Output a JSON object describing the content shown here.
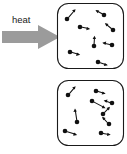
{
  "diagram": {
    "label_heat": "heat",
    "colors": {
      "arrow_gray": "#9b9b9b",
      "particle_black": "#111111",
      "box_outline": "#1a1a1a",
      "background": "#ffffff"
    },
    "heat_arrow": {
      "name": "heat-arrow",
      "direction": "right",
      "shaft_x": 2,
      "shaft_y": 31,
      "shaft_width": 36,
      "shaft_height": 12,
      "head_width": 17,
      "head_height": 24
    },
    "boxes": [
      {
        "id": "hot-box",
        "label": "heated container (fast particles)",
        "x": 57,
        "y": 3,
        "width": 67,
        "height": 66,
        "corner_radius": 11,
        "particle_count": 8,
        "particles": [
          {
            "cx": 67,
            "cy": 19,
            "r": 2.3,
            "vx": 7.5,
            "vy": -8.5
          },
          {
            "cx": 80,
            "cy": 27,
            "r": 2.3,
            "vx": 9.0,
            "vy": 2.0
          },
          {
            "cx": 104,
            "cy": 15,
            "r": 2.3,
            "vx": -8.0,
            "vy": -4.5
          },
          {
            "cx": 113,
            "cy": 30,
            "r": 2.3,
            "vx": -8.5,
            "vy": -7.0
          },
          {
            "cx": 94,
            "cy": 46,
            "r": 2.3,
            "vx": 0.5,
            "vy": -10.0
          },
          {
            "cx": 112,
            "cy": 45,
            "r": 2.3,
            "vx": -9.0,
            "vy": -2.0
          },
          {
            "cx": 70,
            "cy": 52,
            "r": 2.3,
            "vx": 9.5,
            "vy": 2.5
          },
          {
            "cx": 98,
            "cy": 62,
            "r": 2.3,
            "vx": 9.0,
            "vy": 3.0
          }
        ]
      },
      {
        "id": "cold-box",
        "label": "unheated container (slow particles)",
        "x": 57,
        "y": 80,
        "width": 67,
        "height": 66,
        "corner_radius": 11,
        "particle_count": 9,
        "particles": [
          {
            "cx": 68,
            "cy": 95,
            "r": 2.3,
            "vx": 7.0,
            "vy": -8.0
          },
          {
            "cx": 96,
            "cy": 91,
            "r": 2.3,
            "vx": 8.5,
            "vy": 2.5
          },
          {
            "cx": 92,
            "cy": 101,
            "r": 2.3,
            "vx": 14.0,
            "vy": 7.5
          },
          {
            "cx": 112,
            "cy": 103,
            "r": 2.3,
            "vx": -7.0,
            "vy": -2.5
          },
          {
            "cx": 103,
            "cy": 114,
            "r": 2.3,
            "vx": 7.0,
            "vy": -7.5
          },
          {
            "cx": 77,
            "cy": 122,
            "r": 2.3,
            "vx": -2.0,
            "vy": -14.0
          },
          {
            "cx": 109,
            "cy": 124,
            "r": 2.3,
            "vx": -6.5,
            "vy": -7.5
          },
          {
            "cx": 65,
            "cy": 131,
            "r": 2.3,
            "vx": 12.0,
            "vy": 4.0
          },
          {
            "cx": 101,
            "cy": 133,
            "r": 2.3,
            "vx": 8.5,
            "vy": 1.5
          }
        ]
      }
    ]
  }
}
